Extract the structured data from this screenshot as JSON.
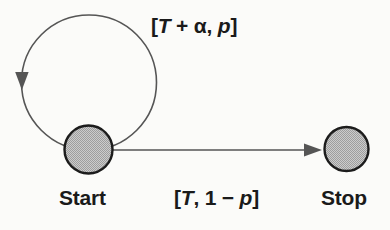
{
  "diagram": {
    "type": "state-transition-diagram",
    "background_color": "#fbfbf9",
    "nodes": [
      {
        "id": "start",
        "label": "Start",
        "cx": 88.5,
        "cy": 149,
        "r": 24.5,
        "fill": "#b4b4b4",
        "stroke": "#1c1c1c"
      },
      {
        "id": "stop",
        "label": "Stop",
        "cx": 346.5,
        "cy": 149,
        "r": 22.5,
        "fill": "#b4b4b4",
        "stroke": "#1c1c1c"
      }
    ],
    "edges": [
      {
        "id": "self-loop",
        "from": "start",
        "to": "start",
        "label_plain": "[T + α, p]",
        "label_parts": [
          "[",
          "T",
          " + α, ",
          "p",
          "]"
        ],
        "stroke": "#4d4d4d",
        "arrow_direction": "down-left"
      },
      {
        "id": "start-to-stop",
        "from": "start",
        "to": "stop",
        "label_plain": "[T, 1 − p]",
        "label_parts": [
          "[",
          "T",
          ", 1 − ",
          "p",
          "]"
        ],
        "stroke": "#4d4d4d",
        "arrow_direction": "right"
      }
    ]
  },
  "labels": {
    "start": "Start",
    "stop": "Stop",
    "loop_bracket_open": "[",
    "loop_T": "T",
    "loop_mid": " + α, ",
    "loop_p": "p",
    "loop_bracket_close": "]",
    "edge_bracket_open": "[",
    "edge_T": "T",
    "edge_mid": ", 1 − ",
    "edge_p": "p",
    "edge_bracket_close": "]"
  }
}
